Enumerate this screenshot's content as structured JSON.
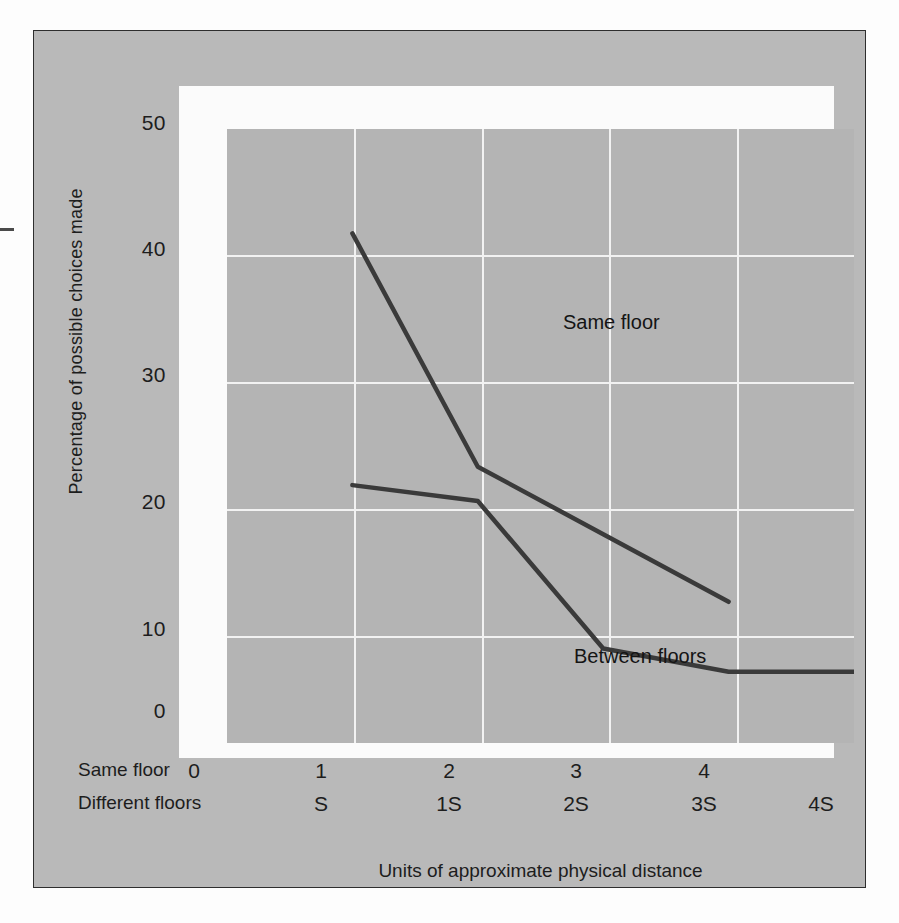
{
  "figure": {
    "background_color": "#b9b9b9",
    "plot_background_color": "#b4b4b4",
    "gridline_color": "#f2f2f2",
    "line_color": "#3a3a3a",
    "border_color": "#2e2e2e"
  },
  "chart_data": {
    "type": "line",
    "title": "",
    "xlabel": "Units of approximate physical distance",
    "ylabel": "Percentage of possible choices made",
    "ylim": [
      0,
      50
    ],
    "yticks": [
      0,
      10,
      20,
      30,
      40,
      50
    ],
    "ytick_labels": [
      "0",
      "10",
      "20",
      "30",
      "40",
      "50"
    ],
    "grid": true,
    "legend_position": "inline-annotations",
    "x_axis_rows": [
      {
        "row_label": "Same floor",
        "ticks": [
          "0",
          "1",
          "2",
          "3",
          "4",
          ""
        ]
      },
      {
        "row_label": "Different floors",
        "ticks": [
          "",
          "S",
          "1S",
          "2S",
          "3S",
          "4S"
        ]
      }
    ],
    "x_positions": [
      0,
      1,
      2,
      3,
      4,
      5
    ],
    "series": [
      {
        "name": "Same floor",
        "annotation": "Same floor",
        "x": [
          1,
          2,
          3,
          4
        ],
        "values": [
          41.5,
          22.5,
          17.0,
          11.5
        ]
      },
      {
        "name": "Between floors",
        "annotation": "Between floors",
        "x": [
          1,
          2,
          3,
          4,
          5
        ],
        "values": [
          21.0,
          19.7,
          7.7,
          5.8,
          5.8
        ]
      }
    ]
  }
}
